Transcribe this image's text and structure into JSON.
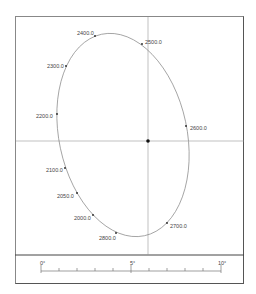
{
  "diagram": {
    "type": "orbit-ellipse",
    "crosshair": {
      "x": 148,
      "y": 141
    },
    "points": [
      {
        "label": "2400.0",
        "x": 95,
        "y": 36,
        "lx": 77,
        "ly": 33
      },
      {
        "label": "2500.0",
        "x": 142,
        "y": 44,
        "lx": 145,
        "ly": 42
      },
      {
        "label": "2300.0",
        "x": 66,
        "y": 66,
        "lx": 47,
        "ly": 66
      },
      {
        "label": "2200.0",
        "x": 57,
        "y": 114,
        "lx": 36,
        "ly": 116
      },
      {
        "label": "2600.0",
        "x": 186,
        "y": 126,
        "lx": 190,
        "ly": 128
      },
      {
        "label": "2100.0",
        "x": 65,
        "y": 168,
        "lx": 46,
        "ly": 170
      },
      {
        "label": "2050.0",
        "x": 77,
        "y": 193,
        "lx": 57,
        "ly": 196
      },
      {
        "label": "2000.0",
        "x": 93,
        "y": 215,
        "lx": 74,
        "ly": 218
      },
      {
        "label": "2700.0",
        "x": 167,
        "y": 223,
        "lx": 170,
        "ly": 226
      },
      {
        "label": "2800.0",
        "x": 116,
        "y": 233,
        "lx": 99,
        "ly": 238
      }
    ]
  },
  "scale": {
    "labels": [
      "0°",
      "5°",
      "10°"
    ],
    "ticks": 11
  }
}
